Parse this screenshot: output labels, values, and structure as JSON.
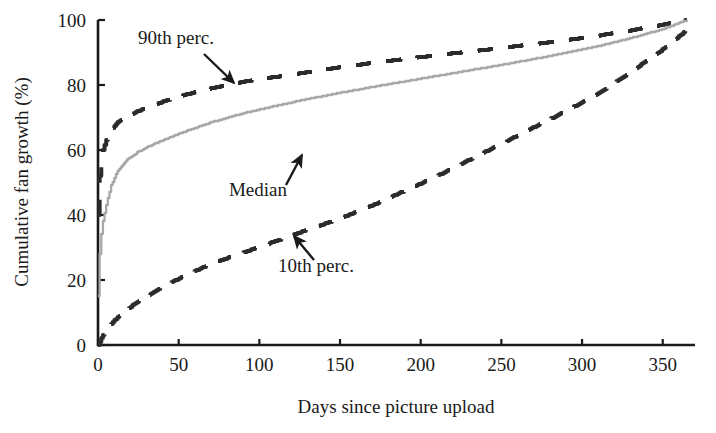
{
  "chart_data": {
    "type": "line",
    "title": "",
    "subtitle": "",
    "xlabel": "Days since picture upload",
    "ylabel": "Cumulative fan growth (%)",
    "xlim": [
      0,
      370
    ],
    "ylim": [
      0,
      100
    ],
    "xticks": [
      0,
      50,
      100,
      150,
      200,
      250,
      300,
      350
    ],
    "xticklabels": [
      "0",
      "50",
      "100",
      "150",
      "200",
      "250",
      "300",
      "350"
    ],
    "yticks": [
      0,
      20,
      40,
      60,
      80,
      100
    ],
    "yticklabels": [
      "0",
      "20",
      "40",
      "60",
      "80",
      "100"
    ],
    "grid": false,
    "legend_position": "none",
    "x": [
      0,
      1,
      2,
      3,
      5,
      8,
      12,
      18,
      25,
      35,
      50,
      70,
      90,
      110,
      130,
      150,
      170,
      190,
      210,
      230,
      250,
      270,
      290,
      310,
      330,
      350,
      365
    ],
    "series": [
      {
        "name": "90th perc.",
        "style": "dashed",
        "color": "#2b2b2b",
        "values": [
          40.0,
          52.0,
          57.0,
          60.0,
          63.0,
          66.0,
          68.5,
          70.5,
          72.0,
          74.0,
          76.5,
          79.0,
          81.0,
          82.5,
          84.0,
          85.5,
          86.8,
          88.0,
          89.2,
          90.3,
          91.4,
          92.6,
          93.8,
          95.2,
          96.8,
          98.6,
          100.0
        ]
      },
      {
        "name": "Median",
        "style": "solid",
        "color": "#a8a8a8",
        "values": [
          15.0,
          28.0,
          34.0,
          38.0,
          43.0,
          49.0,
          53.5,
          57.0,
          59.5,
          62.0,
          65.0,
          68.5,
          71.3,
          73.6,
          75.7,
          77.6,
          79.4,
          81.1,
          82.8,
          84.5,
          86.2,
          88.0,
          89.9,
          92.0,
          94.4,
          97.2,
          100.0
        ]
      },
      {
        "name": "10th perc.",
        "style": "dashed",
        "color": "#2b2b2b",
        "values": [
          0.0,
          1.0,
          2.0,
          3.0,
          4.5,
          6.5,
          8.5,
          11.0,
          13.5,
          16.5,
          20.5,
          25.0,
          28.5,
          32.0,
          35.5,
          39.0,
          43.0,
          47.5,
          52.0,
          57.0,
          62.0,
          67.0,
          72.0,
          77.5,
          84.0,
          91.0,
          97.0
        ]
      }
    ],
    "annotations": [
      {
        "label": "90th perc.",
        "label_x_px": 176,
        "label_y_px": 44,
        "arrow_from_px": [
          204,
          54
        ],
        "arrow_to_px": [
          234,
          83
        ]
      },
      {
        "label": "Median",
        "label_x_px": 258,
        "label_y_px": 196,
        "arrow_from_px": [
          286,
          185
        ],
        "arrow_to_px": [
          302,
          155
        ]
      },
      {
        "label": "10th perc.",
        "label_x_px": 316,
        "label_y_px": 272,
        "arrow_from_px": [
          314,
          260
        ],
        "arrow_to_px": [
          294,
          236
        ]
      }
    ]
  },
  "axes": {
    "x_axis_name": "days-since-picture-upload-axis",
    "y_axis_name": "cumulative-fan-growth-axis"
  },
  "colors": {
    "background": "#ffffff",
    "axis": "#1a1a1a",
    "text": "#1a1a1a",
    "median_line": "#a8a8a8",
    "percentile_line": "#2b2b2b"
  }
}
